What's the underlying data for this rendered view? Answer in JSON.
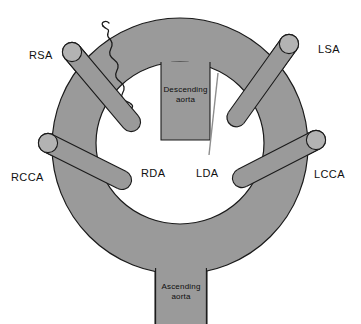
{
  "figure": {
    "name": "double-aortic-arch-vascular-ring",
    "background_color": "#ffffff",
    "ring_fill": "#9a9a9a",
    "vessel_fill": "#9a9a9a",
    "vessel_cap_fill": "#b0b0b0",
    "box_fill": "#9a9a9a",
    "stroke_color": "#1a1a1a",
    "inner_lumen_color": "#ffffff"
  },
  "labels": {
    "rsa": "RSA",
    "lsa": "LSA",
    "rcca": "RCCA",
    "lcca": "LCCA",
    "rda": "RDA",
    "lda": "LDA",
    "descending_aorta_line1": "Descending",
    "descending_aorta_line2": "aorta",
    "ascending_aorta_line1": "Ascending",
    "ascending_aorta_line2": "aorta"
  },
  "structures": {
    "ring": {
      "name": "aortic-ring",
      "outer_cx": 180,
      "outer_cy": 145,
      "outer_rx": 128,
      "outer_ry": 128,
      "inner_cx": 180,
      "inner_cy": 142,
      "inner_rx": 84,
      "inner_ry": 82
    },
    "descending_aorta_box": {
      "name": "descending-aorta-box",
      "x": 160,
      "y": 68,
      "width": 50,
      "height": 72
    },
    "ascending_aorta_box": {
      "name": "ascending-aorta-box",
      "x": 155,
      "y": 272,
      "width": 52,
      "height": 52
    },
    "branches": [
      {
        "name": "right-subclavian-artery",
        "abbr": "RSA",
        "x1": 72,
        "y1": 52,
        "x2": 128,
        "y2": 118,
        "width": 17
      },
      {
        "name": "left-subclavian-artery",
        "abbr": "LSA",
        "x1": 288,
        "y1": 44,
        "x2": 238,
        "y2": 114,
        "width": 17
      },
      {
        "name": "right-common-carotid-artery",
        "abbr": "RCCA",
        "x1": 48,
        "y1": 143,
        "x2": 120,
        "y2": 178,
        "width": 17
      },
      {
        "name": "left-common-carotid-artery",
        "abbr": "LCCA",
        "x1": 318,
        "y1": 140,
        "x2": 244,
        "y2": 175,
        "width": 17
      }
    ],
    "ligament": {
      "name": "ductal-ligament-squiggle",
      "description": "wavy nerve/ligament crossing the ring at upper left"
    },
    "lda_leader_line": {
      "name": "lda-leader-line",
      "x1": 216,
      "y1": 76,
      "x2": 208,
      "y2": 152
    }
  },
  "label_positions": {
    "rsa": {
      "x": 29,
      "y": 59
    },
    "lsa": {
      "x": 318,
      "y": 53
    },
    "rcca": {
      "x": 12,
      "y": 180
    },
    "lcca": {
      "x": 318,
      "y": 177
    },
    "rda": {
      "x": 140,
      "y": 177
    },
    "lda": {
      "x": 197,
      "y": 177
    }
  }
}
